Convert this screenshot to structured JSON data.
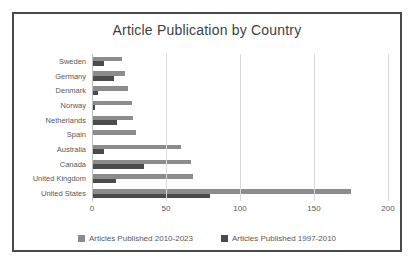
{
  "chart_data": {
    "type": "bar",
    "orientation": "horizontal",
    "title": "Article Publication by Country",
    "categories": [
      "Sweden",
      "Germany",
      "Denmark",
      "Norway",
      "Netherlands",
      "Spain",
      "Australia",
      "Canada",
      "United Kingdom",
      "United States"
    ],
    "series": [
      {
        "name": "Articles Published 2010-2023",
        "color": "#8c8c8c",
        "values": [
          20,
          22,
          24,
          27,
          28,
          30,
          60,
          67,
          68,
          175
        ]
      },
      {
        "name": "Articles Published 1997-2010",
        "color": "#4b4b4b",
        "values": [
          8,
          15,
          4,
          2,
          17,
          1,
          8,
          35,
          16,
          80
        ]
      }
    ],
    "xlabel": "",
    "ylabel": "",
    "xlim": [
      0,
      200
    ],
    "xticks": [
      0,
      50,
      100,
      150,
      200
    ],
    "grid": true,
    "legend_position": "bottom"
  },
  "colors": {
    "gridline": "#d9d9d9",
    "zero_line": "#bfbfbf",
    "text": "#595959",
    "title_text": "#3f3f3f",
    "frame_border": "#4a4a4a",
    "background": "#ffffff"
  }
}
